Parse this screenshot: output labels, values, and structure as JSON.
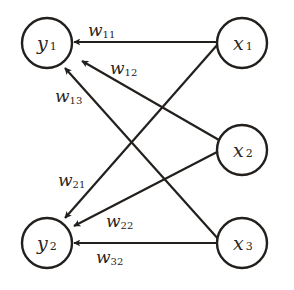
{
  "diagram": {
    "type": "neural-network-weights",
    "colors": {
      "stroke": "#231f1c",
      "background": "#ffffff",
      "text": "#2a2522"
    },
    "nodes": [
      {
        "id": "y1",
        "var": "y",
        "sub": "1",
        "cx": 47,
        "cy": 43,
        "r": 25
      },
      {
        "id": "y2",
        "var": "y",
        "sub": "2",
        "cx": 47,
        "cy": 243,
        "r": 25
      },
      {
        "id": "x1",
        "var": "x",
        "sub": "1",
        "cx": 242,
        "cy": 43,
        "r": 25
      },
      {
        "id": "x2",
        "var": "x",
        "sub": "2",
        "cx": 242,
        "cy": 150,
        "r": 25
      },
      {
        "id": "x3",
        "var": "x",
        "sub": "3",
        "cx": 242,
        "cy": 243,
        "r": 25
      }
    ],
    "edges": [
      {
        "from": "x1",
        "to": "y1",
        "label_var": "w",
        "label_sub": "11"
      },
      {
        "from": "x2",
        "to": "y1",
        "label_var": "w",
        "label_sub": "12"
      },
      {
        "from": "x3",
        "to": "y1",
        "label_var": "w",
        "label_sub": "13"
      },
      {
        "from": "x1",
        "to": "y2",
        "label_var": "w",
        "label_sub": "21"
      },
      {
        "from": "x2",
        "to": "y2",
        "label_var": "w",
        "label_sub": "22"
      },
      {
        "from": "x3",
        "to": "y2",
        "label_var": "w",
        "label_sub": "32"
      }
    ]
  }
}
